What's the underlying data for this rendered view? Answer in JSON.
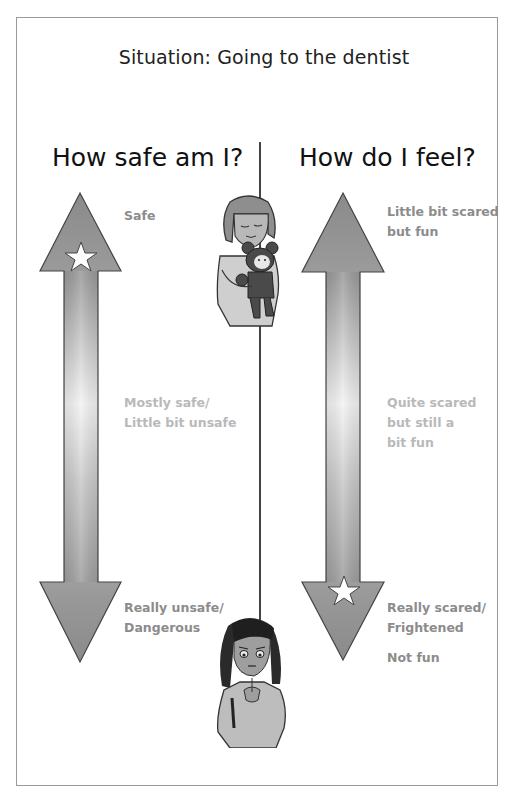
{
  "title": "Situation: Going to the dentist",
  "columns": {
    "left": {
      "heading": "How safe am I?",
      "labels": {
        "top": [
          "Safe"
        ],
        "middle": [
          "Mostly safe/",
          "Little bit unsafe"
        ],
        "bottom": [
          "Really unsafe/",
          "Dangerous"
        ]
      },
      "star_position": "top"
    },
    "right": {
      "heading": "How do I feel?",
      "labels": {
        "top": [
          "Little bit scared",
          "but fun"
        ],
        "middle": [
          "Quite scared",
          "but still a",
          "bit fun"
        ],
        "bottom": [
          "Really scared/",
          "Frightened"
        ],
        "bottom_extra": "Not fun"
      },
      "star_position": "bottom"
    }
  },
  "figures": {
    "top": "girl-hugging-teddy-bear",
    "bottom": "girl-looking-worried"
  },
  "colors": {
    "arrow_dark": "#8a8a8a",
    "arrow_light": "#f4f4f4",
    "label_dark": "#8c8c8c",
    "label_light": "#b9b9b9",
    "frame": "#9a9a9a"
  }
}
